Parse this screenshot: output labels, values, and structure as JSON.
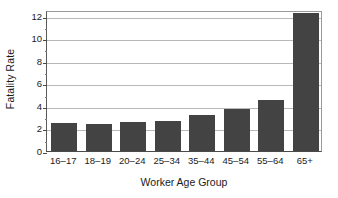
{
  "chart_data": {
    "type": "bar",
    "title": "",
    "xlabel": "Worker Age Group",
    "ylabel": "Fatality Rate",
    "categories": [
      "16–17",
      "18–19",
      "20–24",
      "25–34",
      "35–44",
      "45–54",
      "55–64",
      "65+"
    ],
    "values": [
      2.5,
      2.4,
      2.6,
      2.65,
      3.2,
      3.75,
      4.5,
      12.2
    ],
    "ylim": [
      0,
      12.5
    ],
    "ytick_labels": [
      "0",
      "2",
      "4",
      "6",
      "8",
      "10",
      "12"
    ],
    "ytick_values": [
      0,
      2,
      4,
      6,
      8,
      10,
      12
    ],
    "yminor_tick_values": [
      1,
      3,
      5,
      7,
      9,
      11
    ],
    "grid": true,
    "grid_axis": "y",
    "legend": false,
    "legend_position": "none",
    "bar_color": "#434343",
    "gridline_color": "#b8b8b8",
    "axis_color": "#4a4a4a",
    "background_color": "#ffffff"
  }
}
